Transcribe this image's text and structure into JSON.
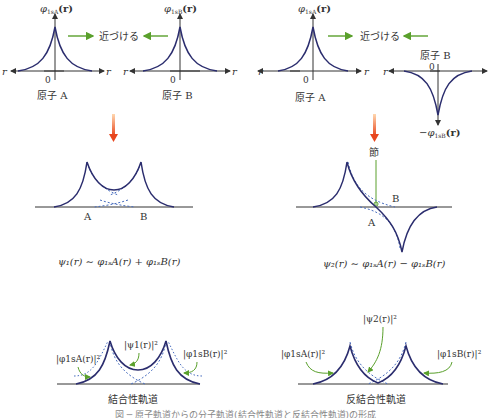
{
  "top": {
    "approach_label": "近づける",
    "left_panel": {
      "atom_a_ylabel_main": "φ",
      "atom_a_ylabel_sub": "1sA",
      "atom_a_ylabel_arg": "(r)",
      "atom_b_ylabel_main": "φ",
      "atom_b_ylabel_sub": "1sB",
      "atom_b_ylabel_arg": "(r)",
      "axis_r": "r",
      "origin": "0",
      "atom_a_name": "原子 A",
      "atom_b_name": "原子 B"
    },
    "right_panel": {
      "atom_a_ylabel_main": "φ",
      "atom_a_ylabel_sub": "1sA",
      "atom_a_ylabel_arg": "(r)",
      "atom_b_ylabel_main": "−φ",
      "atom_b_ylabel_sub": "1sB",
      "atom_b_ylabel_arg": "(r)",
      "axis_r": "r",
      "origin": "0",
      "atom_a_name": "原子 A",
      "atom_b_name": "原子 B"
    }
  },
  "middle": {
    "bonding": {
      "label_a": "A",
      "label_b": "B",
      "formula": "ψ₁(r) ∼ φ₁ₛA(r) + φ₁ₛB(r)"
    },
    "antibonding": {
      "node_label": "節",
      "label_a": "A",
      "label_b": "B",
      "formula": "ψ₂(r) ∼ φ₁ₛA(r) − φ₁ₛB(r)"
    }
  },
  "bottom": {
    "bonding": {
      "label_phiA_sq": "|φ1sA(r)|²",
      "label_psi_sq": "|ψ1(r)|²",
      "label_phiB_sq": "|φ1sB(r)|²",
      "title": "結合性軌道"
    },
    "antibonding": {
      "label_phiA_sq": "|φ1sA(r)|²",
      "label_psi_sq": "|ψ2(r)|²",
      "label_phiB_sq": "|φ1sB(r)|²",
      "title": "反結合性軌道"
    }
  },
  "caption": "図 ─ 原子軌道からの分子軌道(結合性軌道と反結合性軌道)の形成",
  "colors": {
    "curve": "#2b2d6e",
    "dashed": "#4a6fc0",
    "green_arrow": "#5aa02c",
    "orange_arrow": "#e8461e",
    "axis": "#333333"
  }
}
